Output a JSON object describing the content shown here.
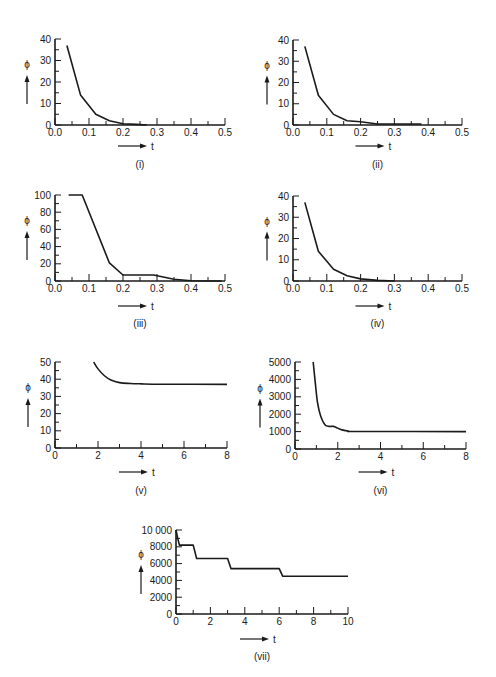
{
  "chart_data": [
    {
      "id": "i",
      "type": "line",
      "panel_label": "(i)",
      "xlabel": "t",
      "ylabel": "ϕ",
      "xlim": [
        0,
        0.5
      ],
      "ylim": [
        0,
        40
      ],
      "xticks": [
        0.0,
        0.1,
        0.2,
        0.3,
        0.4,
        0.5
      ],
      "xtick_labels": [
        "0.0",
        "0.1",
        "0.2",
        "0.3",
        "0.4",
        "0.5"
      ],
      "xminor": 0.05,
      "yticks": [
        0,
        10,
        20,
        30,
        40
      ],
      "ytick_labels": [
        "0",
        "10",
        "20",
        "30",
        "40"
      ],
      "yminor": 5,
      "x": [
        0.035,
        0.075,
        0.12,
        0.16,
        0.2,
        0.24,
        0.27
      ],
      "y": [
        37,
        14,
        5,
        2,
        0.6,
        0.3,
        0
      ]
    },
    {
      "id": "ii",
      "type": "line",
      "panel_label": "(ii)",
      "xlabel": "t",
      "ylabel": "ϕ",
      "xlim": [
        0,
        0.5
      ],
      "ylim": [
        0,
        40
      ],
      "xticks": [
        0.0,
        0.1,
        0.2,
        0.3,
        0.4,
        0.5
      ],
      "xtick_labels": [
        "0.0",
        "0.1",
        "0.2",
        "0.3",
        "0.4",
        "0.5"
      ],
      "xminor": 0.05,
      "yticks": [
        0,
        10,
        20,
        30,
        40
      ],
      "ytick_labels": [
        "0",
        "10",
        "20",
        "30",
        "40"
      ],
      "yminor": 5,
      "x": [
        0.035,
        0.075,
        0.12,
        0.16,
        0.2,
        0.25,
        0.38
      ],
      "y": [
        37,
        14,
        5,
        2,
        1.5,
        0.5,
        0.5
      ]
    },
    {
      "id": "iii",
      "type": "line",
      "panel_label": "(iii)",
      "xlabel": "t",
      "ylabel": "ϕ",
      "xlim": [
        0,
        0.5
      ],
      "ylim": [
        0,
        100
      ],
      "xticks": [
        0.0,
        0.1,
        0.2,
        0.3,
        0.4,
        0.5
      ],
      "xtick_labels": [
        "0.0",
        "0.1",
        "0.2",
        "0.3",
        "0.4",
        "0.5"
      ],
      "xminor": 0.05,
      "yticks": [
        0,
        20,
        40,
        60,
        80,
        100
      ],
      "ytick_labels": [
        "0",
        "20",
        "40",
        "60",
        "80",
        "100"
      ],
      "yminor": 10,
      "x": [
        0.04,
        0.08,
        0.16,
        0.2,
        0.29,
        0.35,
        0.4,
        0.49
      ],
      "y": [
        100,
        100,
        21,
        7,
        7,
        2,
        0.3,
        0
      ]
    },
    {
      "id": "iv",
      "type": "line",
      "panel_label": "(iv)",
      "xlabel": "t",
      "ylabel": "ϕ",
      "xlim": [
        0,
        0.5
      ],
      "ylim": [
        0,
        40
      ],
      "xticks": [
        0.0,
        0.1,
        0.2,
        0.3,
        0.4,
        0.5
      ],
      "xtick_labels": [
        "0.0",
        "0.1",
        "0.2",
        "0.3",
        "0.4",
        "0.5"
      ],
      "xminor": 0.05,
      "yticks": [
        0,
        10,
        20,
        30,
        40
      ],
      "ytick_labels": [
        "0",
        "10",
        "20",
        "30",
        "40"
      ],
      "yminor": 5,
      "x": [
        0.035,
        0.075,
        0.12,
        0.16,
        0.2,
        0.25,
        0.3
      ],
      "y": [
        37,
        14,
        5.5,
        2.5,
        1,
        0.3,
        0
      ]
    },
    {
      "id": "v",
      "type": "line",
      "panel_label": "(v)",
      "xlabel": "t",
      "ylabel": "ϕ",
      "xlim": [
        0,
        8
      ],
      "ylim": [
        0,
        50
      ],
      "xticks": [
        0,
        2,
        4,
        6,
        8
      ],
      "xtick_labels": [
        "0",
        "2",
        "4",
        "6",
        "8"
      ],
      "xminor": 1,
      "yticks": [
        0,
        10,
        20,
        30,
        40,
        50
      ],
      "ytick_labels": [
        "0",
        "10",
        "20",
        "30",
        "40",
        "50"
      ],
      "yminor": 5,
      "x": [
        1.8,
        2.0,
        2.3,
        2.6,
        3.0,
        3.5,
        4.0,
        5.0,
        8.0
      ],
      "y": [
        50,
        46,
        42,
        39.5,
        38,
        37.5,
        37.3,
        37.1,
        37
      ]
    },
    {
      "id": "vi",
      "type": "line",
      "panel_label": "(vi)",
      "xlabel": "t",
      "ylabel": "ϕ",
      "xlim": [
        0,
        8
      ],
      "ylim": [
        0,
        5000
      ],
      "xticks": [
        0,
        2,
        4,
        6,
        8
      ],
      "xtick_labels": [
        "0",
        "2",
        "4",
        "6",
        "8"
      ],
      "xminor": 1,
      "yticks": [
        0,
        1000,
        2000,
        3000,
        4000,
        5000
      ],
      "ytick_labels": [
        "0",
        "1000",
        "2000",
        "3000",
        "4000",
        "5000"
      ],
      "yminor": 500,
      "x": [
        0.85,
        0.95,
        1.05,
        1.2,
        1.4,
        1.6,
        1.8,
        2.0,
        2.2,
        2.5,
        3.0,
        8.0
      ],
      "y": [
        5000,
        3800,
        2700,
        1900,
        1400,
        1300,
        1300,
        1200,
        1100,
        1030,
        1010,
        1000
      ]
    },
    {
      "id": "vii",
      "type": "line",
      "panel_label": "(vii)",
      "xlabel": "t",
      "ylabel": "ϕ",
      "xlim": [
        0,
        10
      ],
      "ylim": [
        0,
        10000
      ],
      "xticks": [
        0,
        2,
        4,
        6,
        8,
        10
      ],
      "xtick_labels": [
        "0",
        "2",
        "4",
        "6",
        "8",
        "10"
      ],
      "xminor": 1,
      "yticks": [
        0,
        2000,
        4000,
        6000,
        8000,
        10000
      ],
      "ytick_labels": [
        "0",
        "2000",
        "4000",
        "6000",
        "8000",
        "10 000"
      ],
      "yminor": 1000,
      "x": [
        0,
        0.1,
        0.2,
        1.0,
        1.2,
        3.0,
        3.2,
        6.0,
        6.2,
        10.0
      ],
      "y": [
        10000,
        9000,
        8200,
        8200,
        6600,
        6600,
        5400,
        5400,
        4500,
        4500
      ]
    }
  ]
}
